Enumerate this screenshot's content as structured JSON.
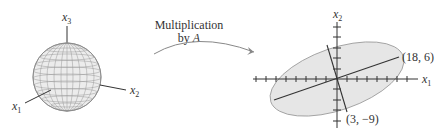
{
  "left_figure": {
    "shape": "unit sphere",
    "axes": {
      "x1": {
        "base": "x",
        "sub": "1"
      },
      "x2": {
        "base": "x",
        "sub": "2"
      },
      "x3": {
        "base": "x",
        "sub": "3"
      }
    }
  },
  "arrow": {
    "line1": "Multiplication",
    "line2_prefix": "by ",
    "line2_var": "A"
  },
  "right_figure": {
    "shape": "ellipse",
    "axes": {
      "x1": {
        "base": "x",
        "sub": "1"
      },
      "x2": {
        "base": "x",
        "sub": "2"
      }
    },
    "points": [
      {
        "label": "(18, 6)",
        "x": 18,
        "y": 6
      },
      {
        "label": "(3, −9)",
        "x": 3,
        "y": -9
      }
    ]
  },
  "colors": {
    "fill": "#e6e6e6",
    "stroke": "#333333",
    "grid": "#888888",
    "outline": "#999999"
  }
}
